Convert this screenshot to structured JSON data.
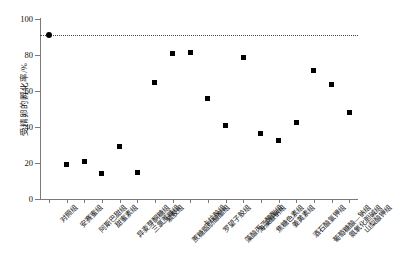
{
  "chart_data": {
    "type": "scatter",
    "title": "",
    "xlabel": "",
    "ylabel": "受精卵的孵化率/%",
    "ylim": [
      0,
      100
    ],
    "yticks": [
      0,
      20,
      40,
      60,
      80,
      100
    ],
    "ytick_labels": [
      "0",
      "20",
      "40",
      "60",
      "80",
      "100"
    ],
    "grid": false,
    "legend": null,
    "reference_line": {
      "value": 91,
      "style": "dotted",
      "color": "#444444",
      "label": ""
    },
    "categories": [
      "对照组",
      "安赛蜜组",
      "阿斯巴甜组",
      "甜蜜素组",
      "异麦芽酮糖组",
      "三氯蔗糖组",
      "紫胶组",
      "蔗糖脂肪酸酯组",
      "卡拉胶组",
      "罗望子胶组",
      "藻酸丙二醇酯组",
      "海藻酸钠组",
      "焦糖色素组",
      "姜黄素组",
      "酒石酸氢钾组",
      "葡萄糖酸—钠组",
      "氨氧化胆碱组",
      "山梨酸钾组"
    ],
    "values": [
      91,
      19,
      21,
      14,
      29,
      15,
      65,
      81,
      81.5,
      56,
      41,
      78.5,
      36.5,
      32.5,
      42.5,
      71.5,
      63.5,
      48
    ],
    "marker_styles": [
      "circle",
      "square",
      "square",
      "square",
      "square",
      "square",
      "square",
      "square",
      "square",
      "square",
      "square",
      "square",
      "square",
      "square",
      "square",
      "square",
      "square",
      "square"
    ]
  }
}
